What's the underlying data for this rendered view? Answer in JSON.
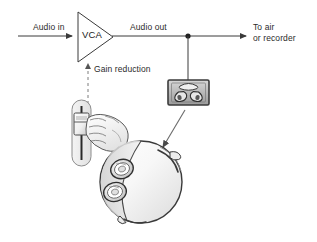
{
  "diagram": {
    "background_color": "#ffffff",
    "line_color": "#3a3a3a",
    "text_color": "#2b2b2b",
    "labels": {
      "audio_in": "Audio in",
      "audio_out": "Audio out",
      "to_air_line1": "To air",
      "to_air_line2": "or recorder",
      "gain_reduction": "Gain reduction",
      "vca": "VCA"
    },
    "nodes": [
      {
        "id": "vca",
        "type": "triangle-amplifier",
        "label": "VCA"
      },
      {
        "id": "junction",
        "type": "junction-dot"
      },
      {
        "id": "loudspeaker",
        "type": "monitor-loudspeaker"
      },
      {
        "id": "fader",
        "type": "vertical-fader"
      },
      {
        "id": "hand",
        "type": "hand-on-fader"
      },
      {
        "id": "head",
        "type": "head-with-headphones"
      }
    ],
    "connections": [
      {
        "from": "audio-in",
        "to": "vca",
        "style": "solid",
        "arrow": "end"
      },
      {
        "from": "vca",
        "to": "to-air",
        "style": "solid",
        "arrow": "end"
      },
      {
        "from": "junction",
        "to": "loudspeaker",
        "style": "solid",
        "arrow": "none"
      },
      {
        "from": "fader",
        "to": "vca",
        "style": "dashed",
        "arrow": "end"
      },
      {
        "from": "loudspeaker",
        "to": "head",
        "style": "solid-thin",
        "arrow": "end"
      }
    ]
  }
}
